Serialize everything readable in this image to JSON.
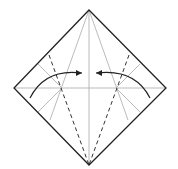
{
  "diagram": {
    "outline": {
      "top": [
        89,
        10
      ],
      "left": [
        14,
        88
      ],
      "right": [
        166,
        88
      ],
      "bottom": [
        89,
        165
      ]
    },
    "stroke_color": "#222222",
    "crease_color": "#aaaaaa",
    "arrows": [
      {
        "name": "left-fold-arrow",
        "direction": "right"
      },
      {
        "name": "right-fold-arrow",
        "direction": "left"
      }
    ]
  }
}
